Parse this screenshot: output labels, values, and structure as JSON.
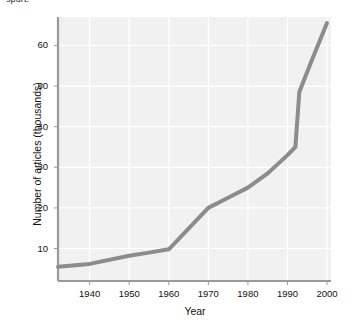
{
  "figure": {
    "cut_caption": "spurt.",
    "background_color": "#ffffff",
    "plot_background_color": "#f1f1f1",
    "grid_color": "#ffffff",
    "axis_color": "#9a9a9a",
    "line_color": "#8c8c8c"
  },
  "chart_data": {
    "type": "line",
    "title": "",
    "xlabel": "Year",
    "ylabel": "Number of articles (thousands)",
    "xlim": [
      1932,
      2001
    ],
    "ylim": [
      2,
      67
    ],
    "xticks": [
      1940,
      1950,
      1960,
      1970,
      1980,
      1990,
      2000
    ],
    "xtick_labels": [
      "1940",
      "1950",
      "1960",
      "1970",
      "1980",
      "1990",
      "2000"
    ],
    "yticks": [
      10,
      20,
      30,
      40,
      50,
      60
    ],
    "ytick_labels": [
      "10",
      "20",
      "30",
      "40",
      "50",
      "60"
    ],
    "grid": true,
    "legend": false,
    "series": [
      {
        "name": "Number of articles",
        "x": [
          1932,
          1940,
          1950,
          1955,
          1960,
          1970,
          1975,
          1980,
          1985,
          1990,
          1992,
          1993,
          1996,
          2000
        ],
        "values": [
          5.5,
          6.2,
          8.2,
          9.0,
          9.8,
          20.0,
          22.5,
          25.0,
          28.5,
          33.0,
          35.0,
          48.5,
          56.0,
          65.5
        ]
      }
    ]
  }
}
